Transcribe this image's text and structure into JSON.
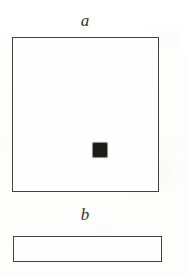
{
  "figure": {
    "kind": "line-drawing-figure",
    "background_color": "#fdfdfc",
    "ink_color": "#4a4644",
    "fill_color": "#1d1b1a",
    "panels": [
      {
        "id": "a",
        "label": "a",
        "shape": "square",
        "description": "large square outline with small solid square at centre",
        "outline_color": "#4a4644",
        "fill_color": "#fefefe",
        "marker": {
          "shape": "square",
          "color": "#1d1b1a",
          "position": "center"
        }
      },
      {
        "id": "b",
        "label": "b",
        "shape": "rectangle",
        "description": "wide flat rectangle outline, empty interior",
        "outline_color": "#4a4644",
        "fill_color": "#fefefe",
        "marker": null
      }
    ]
  }
}
